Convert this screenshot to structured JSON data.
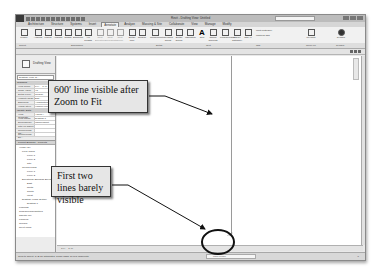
{
  "window": {
    "title": "Revit - Drafting View: Untitled",
    "search_placeholder": "Type a keyword or phrase"
  },
  "ribbon": {
    "tabs": [
      "Architecture",
      "Structure",
      "Systems",
      "Insert",
      "Annotate",
      "Analyze",
      "Massing & Site",
      "Collaborate",
      "View",
      "Manage",
      "Modify"
    ],
    "active_tab": "Annotate",
    "buttons": [
      {
        "label": "Modify",
        "icon": "cursor-icon"
      },
      {
        "label": "Aligned",
        "icon": "aligned-dim-icon"
      },
      {
        "label": "Linear",
        "icon": "linear-dim-icon"
      },
      {
        "label": "Angular",
        "icon": "angular-dim-icon"
      },
      {
        "label": "Radial",
        "icon": "radial-dim-icon"
      },
      {
        "label": "Diameter",
        "icon": "diameter-dim-icon"
      },
      {
        "label": "Arc Length",
        "icon": "arc-length-icon"
      },
      {
        "label": "Spot Elevation",
        "icon": "spot-elevation-icon"
      },
      {
        "label": "Spot Coordinate",
        "icon": "spot-coordinate-icon"
      },
      {
        "label": "Spot Slope",
        "icon": "spot-slope-icon"
      },
      {
        "label": "Detail Line",
        "icon": "detail-line-icon"
      },
      {
        "label": "Region",
        "icon": "region-icon"
      },
      {
        "label": "Component",
        "icon": "component-icon"
      },
      {
        "label": "Revision Cloud",
        "icon": "revision-cloud-icon"
      },
      {
        "label": "Detail Group",
        "icon": "detail-group-icon"
      },
      {
        "label": "Insulation",
        "icon": "insulation-icon"
      },
      {
        "label": "Text",
        "icon": "text-icon"
      },
      {
        "label": "Check Spelling",
        "icon": "spelling-icon"
      },
      {
        "label": "Find/Replace",
        "icon": "find-replace-icon"
      },
      {
        "label": "Tag by Category",
        "icon": "tag-category-icon"
      },
      {
        "label": "Tag All",
        "icon": "tag-all-icon"
      },
      {
        "label": "Multi-Category",
        "icon": "multi-category-icon"
      },
      {
        "label": "Material Tag",
        "icon": "material-tag-icon"
      },
      {
        "label": "Keynote",
        "icon": "keynote-icon"
      },
      {
        "label": "Symbol",
        "icon": "symbol-icon"
      }
    ],
    "panels": [
      "Select",
      "Dimension",
      "Detail",
      "Text",
      "Tag",
      "Color Fill",
      "Symbol"
    ]
  },
  "properties": {
    "family": "Drafting View",
    "type_selector": "Drafting View: D...",
    "categories": [
      "Graphics",
      "Identity Data"
    ],
    "rows": [
      {
        "key": "View Scale",
        "value": "1/4\" = 1'-0\""
      },
      {
        "key": "Scale Value",
        "value": "48"
      },
      {
        "key": "Detail Level",
        "value": "Coarse"
      },
      {
        "key": "Visibility/Grap...",
        "value": "Edit..."
      },
      {
        "key": "Discipline",
        "value": "Architectural"
      },
      {
        "key": "Visual Style",
        "value": "Hidden Line"
      },
      {
        "key": "View Template",
        "value": "<None>"
      },
      {
        "key": "View Name",
        "value": "Drafting 1"
      },
      {
        "key": "Dependency",
        "value": "Independent"
      },
      {
        "key": "Title on Sheet",
        "value": ""
      },
      {
        "key": "Referencing Sh...",
        "value": ""
      },
      {
        "key": "Referencing De...",
        "value": ""
      }
    ],
    "help_link": "Properties help",
    "apply_label": "Apply"
  },
  "project_browser": {
    "title": "Project Browser - Project1",
    "items": [
      {
        "label": "Views (all)",
        "level": 0
      },
      {
        "label": "Floor Plans",
        "level": 1
      },
      {
        "label": "Level 1",
        "level": 2
      },
      {
        "label": "Level 2",
        "level": 2
      },
      {
        "label": "Site",
        "level": 2
      },
      {
        "label": "Ceiling Plans",
        "level": 1
      },
      {
        "label": "Level 1",
        "level": 2
      },
      {
        "label": "Level 2",
        "level": 2
      },
      {
        "label": "Elevations (Building Elevation)",
        "level": 1
      },
      {
        "label": "East",
        "level": 2
      },
      {
        "label": "North",
        "level": 2
      },
      {
        "label": "South",
        "level": 2
      },
      {
        "label": "West",
        "level": 2
      },
      {
        "label": "Drafting Views (Detail)",
        "level": 1
      },
      {
        "label": "Drafting 1",
        "level": 2
      },
      {
        "label": "Legends",
        "level": 0
      },
      {
        "label": "Schedules/Quantities",
        "level": 0
      },
      {
        "label": "Sheets (all)",
        "level": 0
      },
      {
        "label": "Families",
        "level": 0
      },
      {
        "label": "Groups",
        "level": 0
      },
      {
        "label": "Revit Links",
        "level": 0
      }
    ]
  },
  "view_control": {
    "scale": "1/4\" = 1'-0\""
  },
  "status_bar": {
    "message": "Click to select, TAB for alternates, CTRL adds, SHIFT unselects.",
    "workset": "Main Model",
    "filter": "0"
  },
  "callouts": [
    {
      "text": "600′ line visible after Zoom to Fit"
    },
    {
      "text": "First two lines barely visible"
    }
  ],
  "colors": {
    "callout_bg": "#e6e6e6",
    "callout_border": "#333333",
    "ui_gray": "#e9e9e9",
    "line": "#9a9a9a"
  }
}
